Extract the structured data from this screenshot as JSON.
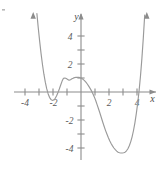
{
  "figure": {
    "title": "",
    "background_color": "#ffffff",
    "curve_color": "#9a9a9a",
    "axis_color": "#8c8c8c",
    "label_color": "#5a5a5a",
    "width": 166,
    "height": 172
  },
  "axes": {
    "x_axis_label": "x",
    "y_axis_label": "y",
    "x_tick_labels": [
      "-4",
      "-2",
      "2",
      "4"
    ],
    "y_tick_labels": [
      "4",
      "2",
      "-2",
      "-4"
    ],
    "x_ticks_values": [
      -4,
      -3,
      -2,
      -1,
      1,
      2,
      3,
      4
    ],
    "y_ticks_values": [
      4,
      3,
      2,
      1,
      -1,
      -2,
      -3,
      -4
    ],
    "x_labeled_values": [
      -4,
      -2,
      2,
      4
    ],
    "y_labeled_values": [
      4,
      2,
      -2,
      -4
    ],
    "x_range": [
      -5.1,
      5.3
    ],
    "y_range": [
      -5.4,
      5.6
    ],
    "grid": false,
    "arrows": [
      "x-positive",
      "y-positive"
    ]
  },
  "chart_data": {
    "type": "line",
    "title": "",
    "xlabel": "x",
    "ylabel": "y",
    "xlim": [
      -5.1,
      5.3
    ],
    "ylim": [
      -5.4,
      5.6
    ],
    "grid": false,
    "legend": null,
    "x_intercepts": [
      -2.6,
      -1.8,
      -1.0,
      1.0,
      4.2
    ],
    "local_extrema": [
      {
        "type": "local-min",
        "x": -2.2,
        "y": -0.55
      },
      {
        "type": "local-max",
        "x": -0.15,
        "y": 1.05
      },
      {
        "type": "local-min",
        "x": 3.2,
        "y": -4.35
      }
    ],
    "series": [
      {
        "name": "curve",
        "color": "#9a9a9a",
        "x": [
          -3.15,
          -3.05,
          -2.95,
          -2.85,
          -2.75,
          -2.65,
          -2.55,
          -2.45,
          -2.35,
          -2.25,
          -2.15,
          -2.05,
          -1.95,
          -1.85,
          -1.75,
          -1.65,
          -1.55,
          -1.45,
          -1.35,
          -1.25,
          -1.15,
          -1.05,
          -0.95,
          -0.85,
          -0.75,
          -0.65,
          -0.55,
          -0.45,
          -0.35,
          -0.25,
          -0.15,
          -0.05,
          0.05,
          0.15,
          0.25,
          0.35,
          0.45,
          0.55,
          0.65,
          0.75,
          0.85,
          0.95,
          1.05,
          1.15,
          1.25,
          1.35,
          1.45,
          1.55,
          1.65,
          1.75,
          1.85,
          1.95,
          2.05,
          2.15,
          2.25,
          2.35,
          2.45,
          2.55,
          2.65,
          2.75,
          2.85,
          2.95,
          3.05,
          3.15,
          3.25,
          3.35,
          3.45,
          3.55,
          3.65,
          3.75,
          3.85,
          3.95,
          4.05,
          4.15,
          4.25,
          4.35,
          4.45,
          4.55
        ],
        "y": [
          5.6,
          4.55,
          3.6,
          2.72,
          1.95,
          1.27,
          0.7,
          0.24,
          -0.12,
          -0.38,
          -0.53,
          -0.6,
          -0.57,
          -0.47,
          -0.29,
          -0.06,
          0.21,
          0.5,
          0.78,
          0.98,
          1.0,
          0.96,
          0.9,
          0.84,
          0.88,
          0.94,
          0.99,
          1.03,
          1.05,
          1.05,
          1.05,
          1.02,
          0.97,
          0.9,
          0.81,
          0.7,
          0.57,
          0.42,
          0.26,
          0.08,
          -0.12,
          -0.35,
          -0.61,
          -0.9,
          -1.2,
          -1.5,
          -1.82,
          -2.14,
          -2.45,
          -2.74,
          -3.0,
          -3.25,
          -3.48,
          -3.68,
          -3.85,
          -4.0,
          -4.12,
          -4.22,
          -4.3,
          -4.34,
          -4.36,
          -4.36,
          -4.34,
          -4.3,
          -4.2,
          -4.05,
          -3.84,
          -3.56,
          -3.2,
          -2.75,
          -2.2,
          -1.55,
          -0.8,
          0.1,
          1.15,
          2.4,
          3.85,
          5.5
        ]
      }
    ]
  }
}
